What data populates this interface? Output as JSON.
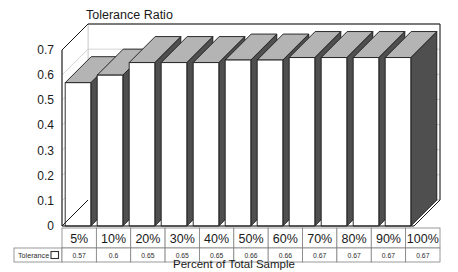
{
  "chart_data": {
    "type": "bar",
    "title": "Tolerance Ratio",
    "xlabel": "Percent of Total Sample",
    "ylabel": "",
    "categories": [
      "5%",
      "10%",
      "20%",
      "30%",
      "40%",
      "50%",
      "60%",
      "70%",
      "80%",
      "90%",
      "100%"
    ],
    "series": [
      {
        "name": "Tolerance",
        "values": [
          0.57,
          0.6,
          0.65,
          0.65,
          0.65,
          0.66,
          0.66,
          0.67,
          0.67,
          0.67,
          0.67
        ]
      }
    ],
    "value_labels": [
      "0.57",
      "0.6",
      "0.65",
      "0.65",
      "0.65",
      "0.66",
      "0.66",
      "0.67",
      "0.67",
      "0.67",
      "0.67"
    ],
    "ylim": [
      0,
      0.7
    ],
    "ytick_labels": [
      "0.7",
      "0.6",
      "0.5",
      "0.4",
      "0.3",
      "0.2",
      "0.1",
      "0"
    ],
    "ytick_values": [
      0.7,
      0.6,
      0.5,
      0.4,
      0.3,
      0.2,
      0.1,
      0
    ],
    "grid": true,
    "legend_position": "data-table",
    "three_d": true,
    "colors": {
      "bar_front": "#ffffff",
      "bar_top": "#b4b4b4",
      "bar_side": "#4f4f4f",
      "outline": "#1a1a1a",
      "gridline": "#c8c8c8",
      "wall": "#ffffff",
      "background": "#ffffff",
      "table_border": "#808080"
    }
  },
  "data_table": {
    "legend_label": "Tolerance",
    "legend_swatch": "hollow-square-swatch",
    "header_row": [
      "5%",
      "10%",
      "20%",
      "30%",
      "40%",
      "50%",
      "60%",
      "70%",
      "80%",
      "90%",
      "100%"
    ],
    "value_row": [
      "0.57",
      "0.6",
      "0.65",
      "0.65",
      "0.65",
      "0.66",
      "0.66",
      "0.67",
      "0.67",
      "0.67",
      "0.67"
    ]
  }
}
